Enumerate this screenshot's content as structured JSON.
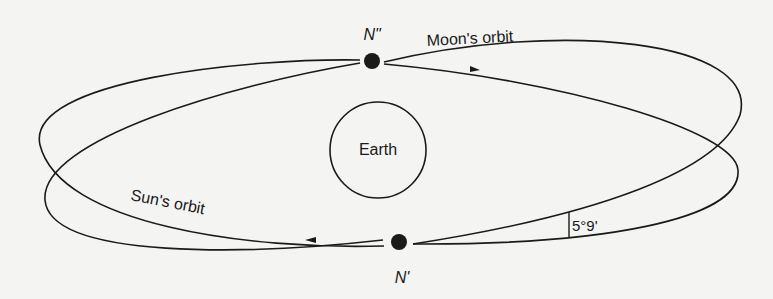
{
  "diagram": {
    "earth_label": "Earth",
    "moon_orbit_label": "Moon's orbit",
    "sun_orbit_label": "Sun's orbit",
    "node_ascending_label": "N\"",
    "node_descending_label": "N'",
    "inclination_label": "5°9'"
  },
  "colors": {
    "ink": "#1a1a1a",
    "background": "#f4f4f2"
  }
}
